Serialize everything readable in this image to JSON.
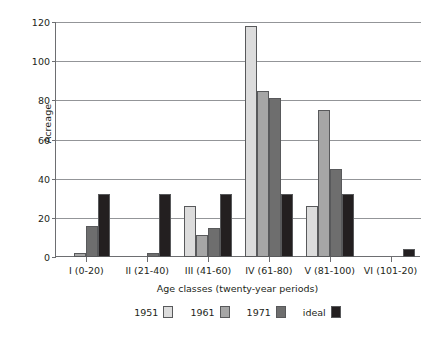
{
  "chart_data": {
    "type": "bar",
    "title": "",
    "xlabel": "Age classes (twenty-year periods)",
    "ylabel": "Acreage",
    "categories": [
      "I (0-20)",
      "II (21-40)",
      "III (41-60)",
      "IV (61-80)",
      "V (81-100)",
      "VI (101-20)"
    ],
    "series": [
      {
        "name": "1951",
        "color": "#dcdcdc",
        "values": [
          0,
          0,
          26,
          118,
          26,
          0
        ]
      },
      {
        "name": "1961",
        "color": "#a6a6a6",
        "values": [
          2,
          0,
          11,
          85,
          75,
          0
        ]
      },
      {
        "name": "1971",
        "color": "#6e6e6e",
        "values": [
          16,
          2,
          15,
          81,
          45,
          0
        ]
      },
      {
        "name": "ideal",
        "color": "#231f20",
        "values": [
          32,
          32,
          32,
          32,
          32,
          4
        ]
      }
    ],
    "ylim": [
      0,
      120
    ],
    "yticks": [
      0,
      20,
      40,
      60,
      80,
      100,
      120
    ],
    "ytick_labels": [
      "0",
      "20",
      "40",
      "60",
      "80",
      "100",
      "120"
    ],
    "grid": true,
    "legend_position": "bottom"
  },
  "legend": {
    "entries": [
      {
        "label": "1951"
      },
      {
        "label": "1961"
      },
      {
        "label": "1971"
      },
      {
        "label": "ideal"
      }
    ]
  },
  "colors": {
    "axis": "#6d6e71",
    "gridline": "#939598",
    "text": "#231f20",
    "background": "#ffffff"
  }
}
